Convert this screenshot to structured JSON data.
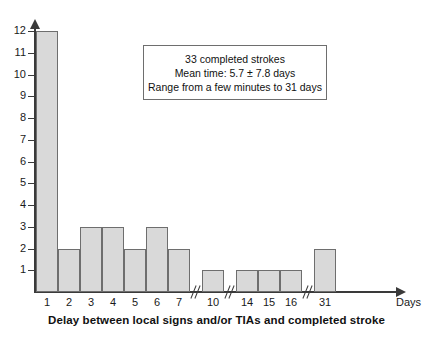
{
  "chart_data": {
    "type": "bar",
    "title": "",
    "xlabel": "Delay between local signs and/or TIAs and completed stroke",
    "ylabel": "",
    "axis_unit_label": "Days",
    "categories": [
      "1",
      "2",
      "3",
      "4",
      "5",
      "6",
      "7",
      "10",
      "14",
      "15",
      "16",
      "31"
    ],
    "values": [
      12,
      2,
      3,
      3,
      2,
      3,
      2,
      1,
      1,
      1,
      1,
      2
    ],
    "ylim": [
      0,
      12
    ],
    "yticks": [
      "1",
      "2",
      "3",
      "4",
      "5",
      "6",
      "7",
      "8",
      "9",
      "10",
      "11",
      "12"
    ],
    "grid": false,
    "legend": null,
    "axis_breaks_after": [
      "7",
      "10",
      "16"
    ],
    "bar_fill_color": "#d9d9d9",
    "bar_edge_color": "#6e6e6e",
    "axis_color": "#3a3a3a",
    "annotations": [
      "33 completed strokes",
      "Mean time: 5.7 ± 7.8 days",
      "Range from a few minutes to 31 days"
    ]
  },
  "note_box": {
    "line1": "33 completed strokes",
    "line2": "Mean time: 5.7 ± 7.8 days",
    "line3": "Range from a few minutes to 31 days"
  },
  "axis": {
    "caption": "Delay between local signs and/or TIAs and completed stroke",
    "days_label": "Days"
  }
}
